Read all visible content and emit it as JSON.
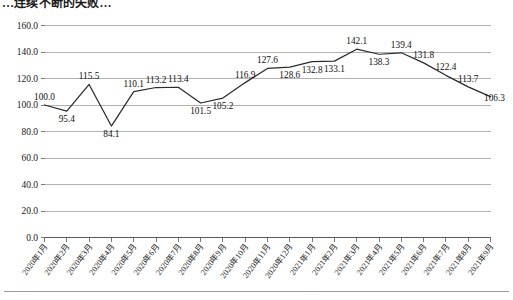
{
  "chart_data": {
    "type": "line",
    "title": "…连续不断的失败…",
    "xlabel": "",
    "ylabel": "",
    "ylim": [
      0.0,
      160.0
    ],
    "ytick_step": 20.0,
    "yticks": [
      "0.0",
      "20.0",
      "40.0",
      "60.0",
      "80.0",
      "100.0",
      "120.0",
      "140.0",
      "160.0"
    ],
    "grid": true,
    "legend": "none",
    "show_data_labels": true,
    "line_color": "#2b2b2b",
    "grid_color": "#a8a8a8",
    "categories": [
      "2020年1月",
      "2020年2月",
      "2020年3月",
      "2020年4月",
      "2020年5月",
      "2020年6月",
      "2020年7月",
      "2020年8月",
      "2020年9月",
      "2020年10月",
      "2020年11月",
      "2020年12月",
      "2021年1月",
      "2021年2月",
      "2021年3月",
      "2021年4月",
      "2021年5月",
      "2021年6月",
      "2021年7月",
      "2021年8月",
      "2021年9月"
    ],
    "values": [
      100.0,
      95.4,
      115.5,
      84.1,
      110.1,
      113.2,
      113.4,
      101.5,
      105.2,
      116.9,
      127.6,
      128.6,
      132.8,
      133.1,
      142.1,
      138.3,
      139.4,
      131.8,
      122.4,
      113.7,
      106.3
    ],
    "value_labels": [
      "100.0",
      "95.4",
      "115.5",
      "84.1",
      "110.1",
      "113.2",
      "113.4",
      "101.5",
      "105.2",
      "116.9",
      "127.6",
      "128.6",
      "132.8",
      "133.1",
      "142.1",
      "138.3",
      "139.4",
      "131.8",
      "122.4",
      "113.7",
      "106.3"
    ],
    "label_placement": [
      "above",
      "below",
      "above",
      "below",
      "above",
      "above",
      "above",
      "below",
      "below",
      "above",
      "above",
      "below",
      "below",
      "below",
      "above",
      "below",
      "above",
      "above",
      "above",
      "above",
      "right"
    ]
  }
}
